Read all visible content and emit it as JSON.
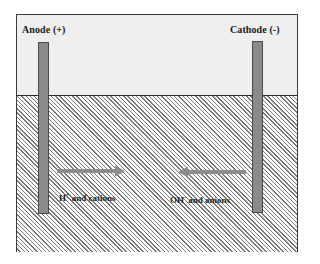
{
  "diagram": {
    "type": "electrolytic cell schematic",
    "electrodes": {
      "anode": {
        "label": "Anode (+)"
      },
      "cathode": {
        "label": "Cathode (-)"
      }
    },
    "ion_migration": [
      {
        "species": "H",
        "charge": "+",
        "suffix": " and cations",
        "direction": "right",
        "toward": "cathode"
      },
      {
        "species": "OH",
        "charge": "-",
        "suffix": " and anions",
        "direction": "left",
        "toward": "anode"
      }
    ],
    "colors": {
      "electrode": "#8a8a8a",
      "arrow": "#8c8c8c",
      "headspace": "#efefef",
      "hatch": "#7a7a7a",
      "border": "#3a3a3a"
    }
  }
}
